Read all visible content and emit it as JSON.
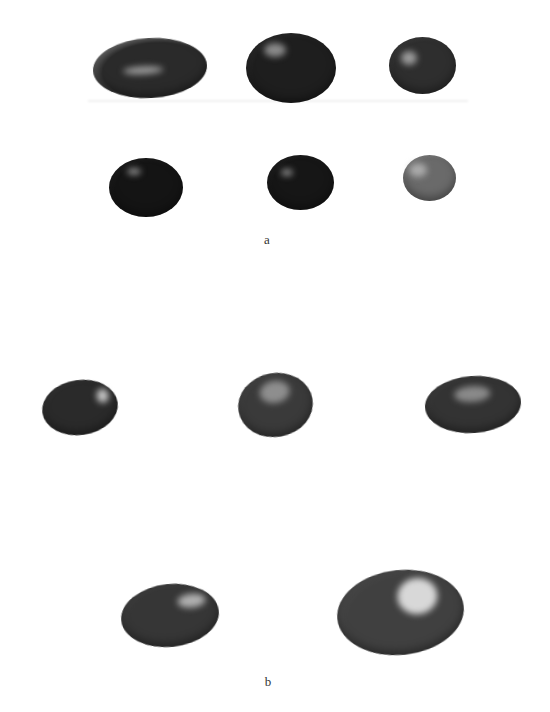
{
  "figure": {
    "panels": [
      {
        "label": "a",
        "label_pos": {
          "x": 267,
          "y": 232
        },
        "items": [
          {
            "name": "stone-a1",
            "x": 93,
            "y": 38,
            "w": 114,
            "h": 60,
            "base": "#2a2a2a",
            "edge": "#cfcfcf",
            "hl": {
              "x": 30,
              "y": 28,
              "w": 40,
              "h": 8,
              "c": "#9a9a9a"
            },
            "rot": -3
          },
          {
            "name": "stone-a2",
            "x": 246,
            "y": 33,
            "w": 90,
            "h": 70,
            "base": "#1e1e1e",
            "edge": "#3a3a3a",
            "hl": {
              "x": 18,
              "y": 10,
              "w": 22,
              "h": 14,
              "c": "#8a8a8a"
            },
            "rot": 0
          },
          {
            "name": "stone-a3",
            "x": 389,
            "y": 37,
            "w": 67,
            "h": 57,
            "base": "#2e2e2e",
            "edge": "#4a4a4a",
            "hl": {
              "x": 12,
              "y": 14,
              "w": 16,
              "h": 14,
              "c": "#9a9a9a"
            },
            "rot": 0
          },
          {
            "name": "stone-a4",
            "x": 109,
            "y": 158,
            "w": 74,
            "h": 59,
            "base": "#141414",
            "edge": "#2a2a2a",
            "hl": {
              "x": 18,
              "y": 10,
              "w": 14,
              "h": 7,
              "c": "#8a8a8a"
            },
            "rot": 0
          },
          {
            "name": "stone-a5",
            "x": 267,
            "y": 155,
            "w": 67,
            "h": 55,
            "base": "#161616",
            "edge": "#2c2c2c",
            "hl": {
              "x": 14,
              "y": 14,
              "w": 12,
              "h": 7,
              "c": "#8a8a8a"
            },
            "rot": 0
          },
          {
            "name": "stone-a6",
            "x": 403,
            "y": 155,
            "w": 53,
            "h": 46,
            "base": "#6a6a6a",
            "edge": "#9a9a9a",
            "hl": {
              "x": 6,
              "y": 8,
              "w": 18,
              "h": 14,
              "c": "#aaaaaa"
            },
            "rot": 0
          }
        ]
      },
      {
        "label": "b",
        "label_pos": {
          "x": 268,
          "y": 674
        },
        "items": [
          {
            "name": "stone-b1",
            "x": 42,
            "y": 380,
            "w": 76,
            "h": 55,
            "base": "#2a2a2a",
            "edge": "#3c3c3c",
            "hl": {
              "x": 56,
              "y": 12,
              "w": 12,
              "h": 14,
              "c": "#c8c8c8"
            },
            "rot": -8
          },
          {
            "name": "stone-b2",
            "x": 238,
            "y": 373,
            "w": 75,
            "h": 64,
            "base": "#3a3a3a",
            "edge": "#505050",
            "hl": {
              "x": 24,
              "y": 8,
              "w": 30,
              "h": 22,
              "c": "#8e8e8e"
            },
            "rot": -10
          },
          {
            "name": "stone-b3",
            "x": 425,
            "y": 376,
            "w": 96,
            "h": 57,
            "base": "#333333",
            "edge": "#484848",
            "hl": {
              "x": 30,
              "y": 10,
              "w": 36,
              "h": 16,
              "c": "#8a8a8a"
            },
            "rot": -4
          },
          {
            "name": "stone-b4",
            "x": 121,
            "y": 584,
            "w": 98,
            "h": 63,
            "base": "#363636",
            "edge": "#4a4a4a",
            "hl": {
              "x": 58,
              "y": 12,
              "w": 28,
              "h": 14,
              "c": "#b0b0b0"
            },
            "rot": -6
          },
          {
            "name": "stone-b5",
            "x": 337,
            "y": 570,
            "w": 127,
            "h": 85,
            "base": "#404040",
            "edge": "#555555",
            "hl": {
              "x": 62,
              "y": 10,
              "w": 40,
              "h": 36,
              "c": "#d8d8d8"
            },
            "rot": -6
          }
        ]
      }
    ]
  }
}
